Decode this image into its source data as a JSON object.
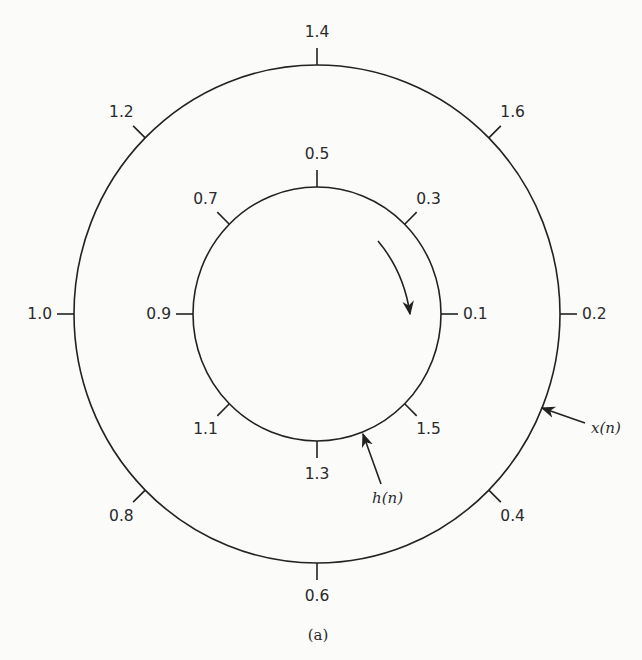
{
  "figure": {
    "caption": "(a)",
    "center": {
      "x": 317,
      "y": 314
    },
    "outer_circle": {
      "label": "x(n)",
      "rx": 243,
      "ry": 249,
      "ticks": [
        {
          "label": "0.2",
          "angle": 0
        },
        {
          "label": "1.6",
          "angle": 45
        },
        {
          "label": "1.4",
          "angle": 90
        },
        {
          "label": "1.2",
          "angle": 135
        },
        {
          "label": "1.0",
          "angle": 180
        },
        {
          "label": "0.8",
          "angle": 225
        },
        {
          "label": "0.6",
          "angle": 270
        },
        {
          "label": "0.4",
          "angle": 315
        }
      ]
    },
    "inner_circle": {
      "label": "h(n)",
      "rx": 124,
      "ry": 127,
      "ticks": [
        {
          "label": "0.1",
          "angle": 0
        },
        {
          "label": "0.3",
          "angle": 45
        },
        {
          "label": "0.5",
          "angle": 90
        },
        {
          "label": "0.7",
          "angle": 135
        },
        {
          "label": "0.9",
          "angle": 180
        },
        {
          "label": "1.1",
          "angle": 225
        },
        {
          "label": "1.3",
          "angle": 270
        },
        {
          "label": "1.5",
          "angle": 315
        }
      ]
    },
    "rotation_arrow": {
      "direction": "clockwise"
    }
  }
}
